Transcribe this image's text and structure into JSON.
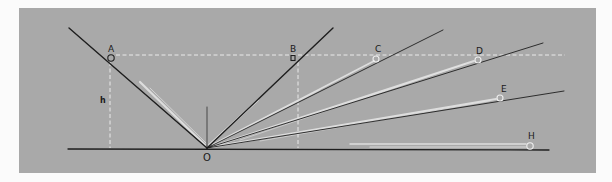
{
  "diagram": {
    "colors": {
      "page_background": "#fbfbfb",
      "panel": "#a9a9a9",
      "line": "#1e1e1e",
      "highlight": "#e6e6e6",
      "dashed": "#f2f2f2",
      "circle": "#f0f0f0"
    },
    "labels": {
      "A": "A",
      "B": "B",
      "C": "C",
      "D": "D",
      "E": "E",
      "H": "H",
      "O": "O",
      "h": "h"
    },
    "points": {
      "O": [
        207,
        148
      ],
      "A": [
        111,
        58
      ],
      "B": [
        293,
        58
      ],
      "C": [
        377,
        59
      ],
      "D": [
        478,
        60
      ],
      "E": [
        500,
        98
      ],
      "H": [
        530,
        146
      ]
    }
  }
}
